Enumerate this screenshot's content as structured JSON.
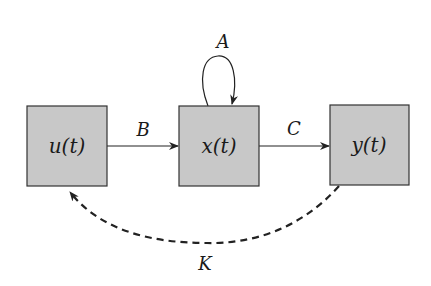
{
  "nodes": [
    {
      "id": "u",
      "label": "u(t)"
    },
    {
      "id": "x",
      "label": "x(t)"
    },
    {
      "id": "y",
      "label": "y(t)"
    }
  ],
  "edges": [
    {
      "from": "u",
      "to": "x",
      "label": "B",
      "style": "solid"
    },
    {
      "from": "x",
      "to": "x",
      "label": "A",
      "style": "solid"
    },
    {
      "from": "x",
      "to": "y",
      "label": "C",
      "style": "solid"
    },
    {
      "from": "y",
      "to": "u",
      "label": "K",
      "style": "dashed"
    }
  ],
  "colors": {
    "box_fill": "#c8c8c8",
    "box_stroke": "#333333",
    "line": "#222222"
  }
}
